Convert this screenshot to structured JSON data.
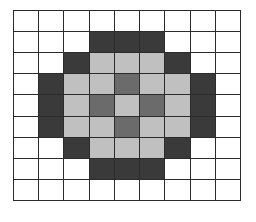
{
  "figure": {
    "name": "pixel-grid-pattern",
    "columns": 9,
    "rows": 9
  },
  "palette": {
    "white": "#ffffff",
    "dark": "#3a3a3a",
    "mid": "#6b6b6b",
    "light": "#c0c0c0",
    "gridline": "#2b2b2b"
  },
  "legend_keys": {
    "white": "white",
    "dark": "dark",
    "mid": "mid",
    "light": "light"
  },
  "chart_data": {
    "type": "heatmap",
    "title": "",
    "xlabel": "",
    "ylabel": "",
    "grid": true,
    "legend": "none",
    "categories": [
      "0",
      "1",
      "2",
      "3",
      "4",
      "5",
      "6",
      "7",
      "8"
    ],
    "row_labels": [
      "0",
      "1",
      "2",
      "3",
      "4",
      "5",
      "6",
      "7",
      "8"
    ],
    "value_scale": {
      "white": 0,
      "light": 1,
      "mid": 2,
      "dark": 3
    },
    "cells": [
      [
        "white",
        "white",
        "white",
        "white",
        "white",
        "white",
        "white",
        "white",
        "white"
      ],
      [
        "white",
        "white",
        "white",
        "dark",
        "dark",
        "dark",
        "white",
        "white",
        "white"
      ],
      [
        "white",
        "white",
        "dark",
        "light",
        "light",
        "light",
        "dark",
        "white",
        "white"
      ],
      [
        "white",
        "dark",
        "light",
        "light",
        "mid",
        "light",
        "light",
        "dark",
        "white"
      ],
      [
        "white",
        "dark",
        "light",
        "mid",
        "light",
        "mid",
        "light",
        "dark",
        "white"
      ],
      [
        "white",
        "dark",
        "light",
        "light",
        "mid",
        "light",
        "light",
        "dark",
        "white"
      ],
      [
        "white",
        "white",
        "dark",
        "light",
        "light",
        "light",
        "dark",
        "white",
        "white"
      ],
      [
        "white",
        "white",
        "white",
        "dark",
        "dark",
        "dark",
        "white",
        "white",
        "white"
      ],
      [
        "white",
        "white",
        "white",
        "white",
        "white",
        "white",
        "white",
        "white",
        "white"
      ]
    ]
  }
}
